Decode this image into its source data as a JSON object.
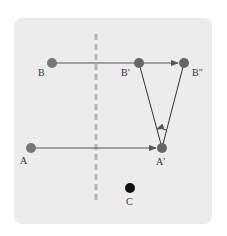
{
  "diagram": {
    "title": "",
    "colors": {
      "panel": "#ececec",
      "point": "#707070",
      "point_c": "#111111",
      "line": "#555555",
      "dashed": "#b8b8b8"
    },
    "points": [
      {
        "id": "B",
        "label": "B",
        "x": 52,
        "y": 63
      },
      {
        "id": "B1",
        "label": "B′",
        "x": 139,
        "y": 63
      },
      {
        "id": "B2",
        "label": "B″",
        "x": 184,
        "y": 63
      },
      {
        "id": "A",
        "label": "A",
        "x": 31,
        "y": 148
      },
      {
        "id": "A1",
        "label": "A′",
        "x": 162,
        "y": 148
      },
      {
        "id": "C",
        "label": "C",
        "x": 130,
        "y": 188
      }
    ],
    "arrows": [
      {
        "from": "B",
        "to": "B2",
        "kind": "translation"
      },
      {
        "from": "A",
        "to": "A1",
        "kind": "translation"
      }
    ],
    "segments": [
      {
        "from": "A1",
        "to": "B1"
      },
      {
        "from": "A1",
        "to": "B2"
      }
    ],
    "rotation_arc": {
      "center": "A1",
      "direction": "counterclockwise"
    },
    "mirror_line": {
      "style": "dashed",
      "x": 96
    }
  }
}
